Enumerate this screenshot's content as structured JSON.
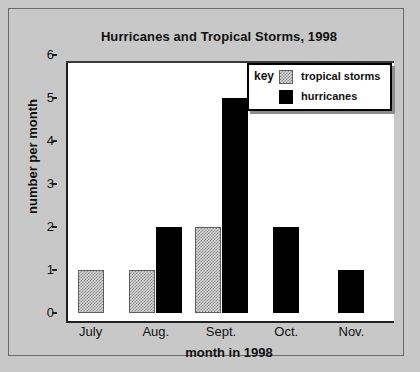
{
  "chart_data": {
    "type": "bar",
    "title": "Hurricanes and Tropical Storms, 1998",
    "xlabel": "month in 1998",
    "ylabel": "number per month",
    "categories": [
      "July",
      "Aug.",
      "Sept.",
      "Oct.",
      "Nov."
    ],
    "series": [
      {
        "name": "tropical storms",
        "color": "#a8a8a8",
        "values": [
          1,
          1,
          2,
          0,
          0
        ]
      },
      {
        "name": "hurricanes",
        "color": "#000000",
        "values": [
          0,
          2,
          5,
          2,
          1
        ]
      }
    ],
    "ylim": [
      0,
      6
    ],
    "yticks": [
      0,
      1,
      2,
      3,
      4,
      5,
      6
    ],
    "grid": false,
    "legend": {
      "title": "key",
      "position": "top-right"
    }
  },
  "legend": {
    "title": "key",
    "entries": [
      {
        "label": "tropical storms",
        "swatch": "tropical"
      },
      {
        "label": "hurricanes",
        "swatch": "hurricane"
      }
    ]
  }
}
